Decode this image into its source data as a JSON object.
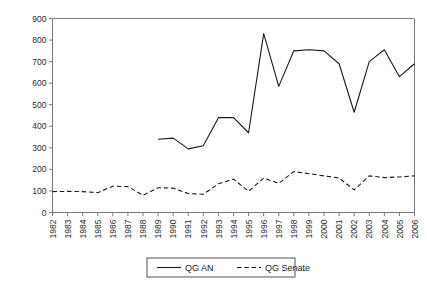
{
  "chart_data": {
    "type": "line",
    "title": "",
    "subtitle": "",
    "xlabel": "",
    "ylabel": "",
    "grid": false,
    "legend_position": "bottom-center",
    "xlim": [
      1982,
      2006
    ],
    "ylim": [
      0,
      900
    ],
    "ytick_step": 100,
    "yticks": [
      0,
      100,
      200,
      300,
      400,
      500,
      600,
      700,
      800,
      900
    ],
    "ytick_labels": [
      "0",
      "100",
      "200",
      "300",
      "400",
      "500",
      "600",
      "700",
      "800",
      "900"
    ],
    "categories": [
      1982,
      1983,
      1984,
      1985,
      1986,
      1987,
      1988,
      1989,
      1990,
      1991,
      1992,
      1993,
      1994,
      1995,
      1996,
      1997,
      1998,
      1999,
      2000,
      2001,
      2002,
      2003,
      2004,
      2005,
      2006
    ],
    "xtick_labels": [
      "1982",
      "1983",
      "1984",
      "1985",
      "1986",
      "1987",
      "1988",
      "1989",
      "1990",
      "1991",
      "1992",
      "1993",
      "1994",
      "1995",
      "1996",
      "1997",
      "1998",
      "1999",
      "2000",
      "2001",
      "2002",
      "2003",
      "2004",
      "2005",
      "2006"
    ],
    "series": [
      {
        "name": "QG AN",
        "style": "solid",
        "color": "#1a1a1a",
        "x": [
          1989,
          1990,
          1991,
          1992,
          1993,
          1994,
          1995,
          1996,
          1997,
          1998,
          1999,
          2000,
          2001,
          2002,
          2003,
          2004,
          2005,
          2006
        ],
        "values": [
          340,
          345,
          295,
          310,
          440,
          440,
          370,
          830,
          585,
          750,
          755,
          750,
          690,
          465,
          700,
          755,
          630,
          690
        ]
      },
      {
        "name": "QG Senate",
        "style": "dashed",
        "color": "#1a1a1a",
        "x": [
          1982,
          1983,
          1984,
          1985,
          1986,
          1987,
          1988,
          1989,
          1990,
          1991,
          1992,
          1993,
          1994,
          1995,
          1996,
          1997,
          1998,
          1999,
          2000,
          2001,
          2002,
          2003,
          2004,
          2005,
          2006
        ],
        "values": [
          97,
          98,
          97,
          92,
          122,
          120,
          80,
          115,
          113,
          88,
          85,
          133,
          155,
          98,
          160,
          135,
          190,
          180,
          170,
          160,
          105,
          170,
          162,
          165,
          170
        ]
      }
    ]
  },
  "legend": {
    "items": [
      {
        "label": "QG AN",
        "style": "solid"
      },
      {
        "label": "QG Senate",
        "style": "dashed"
      }
    ]
  },
  "colors": {
    "axis": "#7a7a7a",
    "line": "#1a1a1a",
    "text": "#2b2b2b",
    "background": "#ffffff"
  }
}
